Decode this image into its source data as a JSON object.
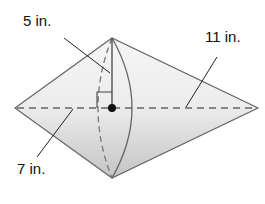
{
  "figure": {
    "type": "double-cone",
    "labels": {
      "radius": "5 in.",
      "slant_right": "11 in.",
      "slant_left": "7 in."
    },
    "colors": {
      "fill_light": "#f4f4f4",
      "fill_dark": "#c8c8c8",
      "stroke": "#555555",
      "dash": "#666666",
      "text": "#111111"
    }
  }
}
